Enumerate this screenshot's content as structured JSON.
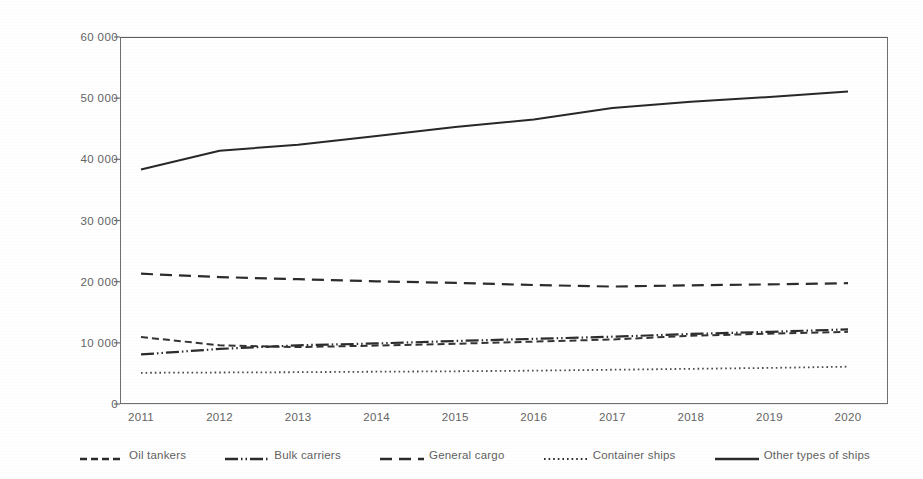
{
  "chart_data": {
    "type": "line",
    "title": "",
    "subtitle": "",
    "xlabel": "",
    "ylabel": "",
    "x": [
      2011,
      2012,
      2013,
      2014,
      2015,
      2016,
      2017,
      2018,
      2019,
      2020
    ],
    "categories": [
      "2011",
      "2012",
      "2013",
      "2014",
      "2015",
      "2016",
      "2017",
      "2018",
      "2019",
      "2020"
    ],
    "ylim": [
      0,
      60000
    ],
    "yticks": [
      0,
      10000,
      20000,
      30000,
      40000,
      50000,
      60000
    ],
    "ytick_labels": [
      "0",
      "10 000",
      "20 000",
      "30 000",
      "40 000",
      "50 000",
      "60 000"
    ],
    "grid": "horizontal",
    "legend_position": "bottom",
    "series": [
      {
        "name": "Oil tankers",
        "style": "dashed",
        "color": "#333333",
        "values": [
          10950,
          9600,
          9300,
          9550,
          9850,
          10200,
          10550,
          11150,
          11500,
          11800
        ]
      },
      {
        "name": "Bulk carriers",
        "style": "dash-dot-dot",
        "color": "#2b2b2b",
        "values": [
          8100,
          9000,
          9600,
          9900,
          10300,
          10650,
          11000,
          11450,
          11800,
          12200
        ]
      },
      {
        "name": "General cargo",
        "style": "long-dashed",
        "color": "#2b2b2b",
        "values": [
          21300,
          20750,
          20400,
          20050,
          19800,
          19450,
          19200,
          19400,
          19550,
          19750
        ]
      },
      {
        "name": "Container ships",
        "style": "dotted",
        "color": "#4a4a4a",
        "values": [
          5100,
          5150,
          5200,
          5280,
          5350,
          5450,
          5600,
          5750,
          5900,
          6100
        ]
      },
      {
        "name": "Other types of ships",
        "style": "solid",
        "color": "#272727",
        "values": [
          38350,
          41400,
          42400,
          43800,
          45300,
          46500,
          48400,
          49400,
          50200,
          51100
        ]
      }
    ]
  },
  "axes": {
    "y_tick_labels": [
      "60 000",
      "50 000",
      "40 000",
      "30 000",
      "20 000",
      "10 000",
      "0"
    ],
    "x_tick_labels": [
      "2011",
      "2012",
      "2013",
      "2014",
      "2015",
      "2016",
      "2017",
      "2018",
      "2019",
      "2020"
    ]
  },
  "legend": {
    "items": [
      {
        "label": "Oil tankers",
        "style": "dashed"
      },
      {
        "label": "Bulk carriers",
        "style": "dash-dot-dot"
      },
      {
        "label": "General cargo",
        "style": "long-dashed"
      },
      {
        "label": "Container ships",
        "style": "dotted"
      },
      {
        "label": "Other types of ships",
        "style": "solid"
      }
    ]
  },
  "colors": {
    "axis": "#6f6f6f",
    "grid": "#d9d9d9",
    "text": "#636363",
    "line": "#2b2b2b",
    "background": "#ffffff"
  }
}
